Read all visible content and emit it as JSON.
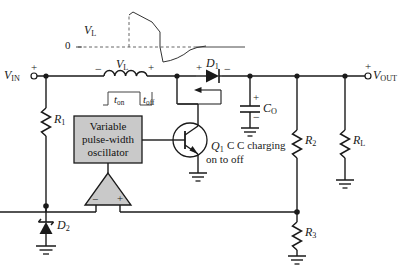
{
  "figure": {
    "type": "schematic-diagram",
    "background": "#ffffff",
    "line_color": "#1a1a1a",
    "fill_gray": "#c9c9c9"
  },
  "waveform": {
    "label": "V",
    "label_sub": "L",
    "zero_label": "0",
    "description": "Inductor voltage waveform: positive decaying pulse during t-on, negative spike decaying back to zero during t-off"
  },
  "terminals": {
    "input": {
      "label": "V",
      "label_sub": "IN",
      "polarity": "+"
    },
    "output": {
      "label": "V",
      "label_sub": "OUT",
      "polarity": "+"
    }
  },
  "components": {
    "inductor": {
      "label": "V",
      "label_sub": "L",
      "left_sign": "−",
      "right_sign": "+"
    },
    "diode_d1": {
      "label": "D",
      "label_sub": "1",
      "left_sign": "+",
      "right_sign": "−"
    },
    "diode_d2": {
      "label": "D",
      "label_sub": "2",
      "type": "zener"
    },
    "capacitor_co": {
      "label": "C",
      "label_sub": "O",
      "top_sign": "+",
      "bottom_sign": "−"
    },
    "transistor_q1": {
      "label": "Q",
      "label_sub": "1",
      "note": "on to off",
      "type": "npn"
    },
    "resistor_r1": {
      "label": "R",
      "label_sub": "1"
    },
    "resistor_r2": {
      "label": "R",
      "label_sub": "2"
    },
    "resistor_r3": {
      "label": "R",
      "label_sub": "3"
    },
    "resistor_rl": {
      "label": "R",
      "label_sub": "L"
    }
  },
  "oscillator_block": {
    "line1": "Variable",
    "line2": "pulse-width",
    "line3": "oscillator"
  },
  "comparator": {
    "minus_input": "−",
    "plus_input": "+"
  },
  "timing_waveform": {
    "t_on": "t",
    "t_on_sub": "on",
    "t_off": "t",
    "t_off_sub": "off"
  },
  "annotations": {
    "capacitor_charging": "C charging"
  }
}
